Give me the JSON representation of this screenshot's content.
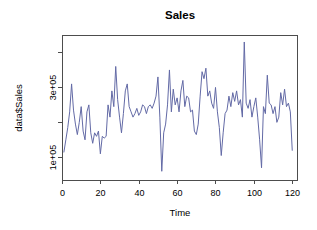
{
  "figure": {
    "width": 317,
    "height": 230,
    "background": "#ffffff",
    "frame_color": "#4d4d4d",
    "plot_box": {
      "left": 62,
      "top": 35,
      "right": 298,
      "bottom": 180
    }
  },
  "chart_data": {
    "type": "line",
    "title": "Sales",
    "xlabel": "Time",
    "ylabel": "data$Sales",
    "line_color": "#636aa6",
    "grid": false,
    "legend": null,
    "xlim": [
      0,
      123
    ],
    "ylim": [
      35000,
      450000
    ],
    "xticks": [
      0,
      20,
      40,
      60,
      80,
      100,
      120
    ],
    "xtick_labels": [
      "0",
      "20",
      "40",
      "60",
      "80",
      "100",
      "120"
    ],
    "yticks": [
      100000,
      200000,
      300000,
      400000
    ],
    "ytick_labels": [
      "1e+05",
      "",
      "3e+05",
      ""
    ],
    "ytick_labels_shown": [
      "1e+05",
      "3e+05"
    ],
    "x": [
      1,
      2,
      3,
      4,
      5,
      6,
      7,
      8,
      9,
      10,
      11,
      12,
      13,
      14,
      15,
      16,
      17,
      18,
      19,
      20,
      21,
      22,
      23,
      24,
      25,
      26,
      27,
      28,
      29,
      30,
      31,
      32,
      33,
      34,
      35,
      36,
      37,
      38,
      39,
      40,
      41,
      42,
      43,
      44,
      45,
      46,
      47,
      48,
      49,
      50,
      51,
      52,
      53,
      54,
      55,
      56,
      57,
      58,
      59,
      60,
      61,
      62,
      63,
      64,
      65,
      66,
      67,
      68,
      69,
      70,
      71,
      72,
      73,
      74,
      75,
      76,
      77,
      78,
      79,
      80,
      81,
      82,
      83,
      84,
      85,
      86,
      87,
      88,
      89,
      90,
      91,
      92,
      93,
      94,
      95,
      96,
      97,
      98,
      99,
      100,
      101,
      102,
      103,
      104,
      105,
      106,
      107,
      108,
      109,
      110,
      111,
      112,
      113,
      114,
      115,
      116,
      117,
      118,
      119,
      120,
      121,
      122
    ],
    "y": [
      115000,
      150000,
      185000,
      230000,
      310000,
      235000,
      195000,
      165000,
      200000,
      245000,
      175000,
      150000,
      230000,
      250000,
      170000,
      140000,
      170000,
      160000,
      175000,
      110000,
      160000,
      155000,
      160000,
      250000,
      215000,
      290000,
      245000,
      360000,
      265000,
      215000,
      170000,
      225000,
      290000,
      310000,
      245000,
      230000,
      215000,
      225000,
      240000,
      220000,
      230000,
      250000,
      245000,
      225000,
      245000,
      250000,
      240000,
      255000,
      275000,
      330000,
      215000,
      60000,
      170000,
      195000,
      250000,
      350000,
      230000,
      295000,
      250000,
      270000,
      230000,
      290000,
      320000,
      245000,
      275000,
      270000,
      230000,
      235000,
      175000,
      165000,
      195000,
      275000,
      345000,
      325000,
      355000,
      275000,
      290000,
      255000,
      240000,
      300000,
      230000,
      185000,
      105000,
      170000,
      225000,
      235000,
      275000,
      245000,
      285000,
      260000,
      290000,
      250000,
      265000,
      215000,
      430000,
      255000,
      240000,
      265000,
      215000,
      245000,
      270000,
      215000,
      150000,
      70000,
      245000,
      225000,
      335000,
      255000,
      250000,
      225000,
      245000,
      200000,
      215000,
      285000,
      250000,
      295000,
      245000,
      255000,
      230000,
      120000
    ],
    "units_note": "values in Sales units; axis shown in scientific notation"
  }
}
